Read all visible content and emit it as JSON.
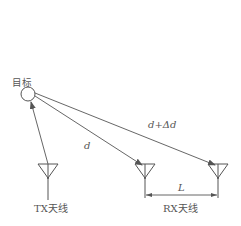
{
  "diagram": {
    "target_label": "目标",
    "tx_label": "TX天线",
    "rx_label": "RX天线",
    "path_direct_label": "d",
    "path_extra_label": "d+Δd",
    "baseline_label": "L",
    "colors": {
      "line": "#555555",
      "background": "#ffffff"
    }
  }
}
